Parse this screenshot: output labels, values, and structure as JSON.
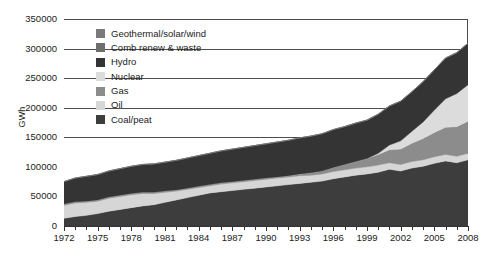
{
  "chart_data": {
    "type": "area",
    "stacked": true,
    "title": "",
    "xlabel": "",
    "ylabel": "GWh",
    "ylim": [
      0,
      350000
    ],
    "ytick_step": 50000,
    "ytick_labels": [
      "350000",
      "300000",
      "250000",
      "200000",
      "150000",
      "100000",
      "50000",
      "0"
    ],
    "ytick_values": [
      350000,
      300000,
      250000,
      200000,
      150000,
      100000,
      50000,
      0
    ],
    "gridlines": [
      300000,
      250000,
      200000,
      150000
    ],
    "grid": true,
    "legend_position": "inside-top-left",
    "xlim": [
      1972,
      2008
    ],
    "x": [
      1972,
      1973,
      1974,
      1975,
      1976,
      1977,
      1978,
      1979,
      1980,
      1981,
      1982,
      1983,
      1984,
      1985,
      1986,
      1987,
      1988,
      1989,
      1990,
      1991,
      1992,
      1993,
      1994,
      1995,
      1996,
      1997,
      1998,
      1999,
      2000,
      2001,
      2002,
      2003,
      2004,
      2005,
      2006,
      2007,
      2008
    ],
    "xtick_labels": [
      "1972",
      "1975",
      "1978",
      "1981",
      "1984",
      "1987",
      "1990",
      "1993",
      "1996",
      "1999",
      "2002",
      "2005",
      "2008"
    ],
    "xtick_values": [
      1972,
      1975,
      1978,
      1981,
      1984,
      1987,
      1990,
      1993,
      1996,
      1999,
      2002,
      2005,
      2008
    ],
    "series": [
      {
        "name": "Coal/peat",
        "color": "#3d3d3d",
        "values": [
          13000,
          16000,
          18000,
          21000,
          25000,
          28000,
          31000,
          34000,
          36000,
          40000,
          44000,
          48000,
          52000,
          56000,
          58000,
          60000,
          62000,
          64000,
          66000,
          68000,
          70000,
          72000,
          74000,
          76000,
          80000,
          83000,
          86000,
          88000,
          91000,
          96000,
          93000,
          98000,
          101000,
          106000,
          110000,
          107000,
          112000
        ]
      },
      {
        "name": "Oil",
        "color": "#d6d6d6",
        "values": [
          22000,
          23000,
          22000,
          21000,
          22000,
          22000,
          22000,
          21000,
          19000,
          17000,
          15000,
          14000,
          13000,
          12000,
          13000,
          13000,
          13000,
          13000,
          13000,
          13000,
          13000,
          13000,
          12000,
          12000,
          12000,
          12000,
          12000,
          12000,
          12000,
          11000,
          11000,
          11000,
          11000,
          11000,
          11000,
          11000,
          11000
        ]
      },
      {
        "name": "Gas",
        "color": "#8c8c8c",
        "values": [
          2000,
          2000,
          2000,
          2000,
          2000,
          2000,
          2000,
          2000,
          2000,
          2000,
          2000,
          2000,
          2000,
          2000,
          2000,
          2000,
          2000,
          2000,
          2000,
          2000,
          2000,
          3000,
          4000,
          5000,
          7000,
          9000,
          11000,
          14000,
          18000,
          22000,
          26000,
          31000,
          36000,
          41000,
          46000,
          50000,
          54000
        ]
      },
      {
        "name": "Nuclear",
        "color": "#dcdcdc",
        "values": [
          0,
          0,
          0,
          0,
          0,
          0,
          0,
          0,
          0,
          0,
          0,
          0,
          0,
          0,
          0,
          0,
          0,
          0,
          0,
          0,
          0,
          0,
          0,
          0,
          0,
          0,
          0,
          0,
          2000,
          8000,
          14000,
          20000,
          28000,
          38000,
          48000,
          56000,
          62000
        ]
      },
      {
        "name": "Hydro",
        "color": "#343434",
        "values": [
          38000,
          40000,
          42000,
          43000,
          44000,
          45000,
          46000,
          47000,
          48000,
          49000,
          50000,
          51000,
          52000,
          53000,
          54000,
          55000,
          56000,
          57000,
          58000,
          59000,
          60000,
          61000,
          62000,
          63000,
          64000,
          64000,
          65000,
          65000,
          66000,
          66000,
          67000,
          67000,
          68000,
          68000,
          69000,
          69000,
          70000
        ]
      },
      {
        "name": "Comb renew & waste",
        "color": "#6e6e6e",
        "values": [
          0,
          0,
          0,
          0,
          0,
          0,
          0,
          0,
          0,
          0,
          0,
          0,
          0,
          0,
          0,
          0,
          0,
          0,
          0,
          0,
          0,
          0,
          0,
          0,
          0,
          0,
          0,
          0,
          0,
          0,
          0,
          0,
          0,
          0,
          0,
          0,
          0
        ]
      },
      {
        "name": "Geothermal/solar/wind",
        "color": "#7a7a7a",
        "values": [
          0,
          0,
          0,
          0,
          0,
          0,
          0,
          0,
          0,
          0,
          0,
          0,
          0,
          0,
          0,
          0,
          0,
          0,
          0,
          0,
          0,
          0,
          0,
          0,
          0,
          0,
          0,
          0,
          0,
          0,
          0,
          0,
          0,
          0,
          0,
          0,
          0
        ]
      }
    ],
    "legend_entries": [
      {
        "label": "Geothermal/solar/wind",
        "color": "#7a7a7a"
      },
      {
        "label": "Comb renew & waste",
        "color": "#6e6e6e"
      },
      {
        "label": "Hydro",
        "color": "#343434"
      },
      {
        "label": "Nuclear",
        "color": "#dcdcdc"
      },
      {
        "label": "Gas",
        "color": "#8c8c8c"
      },
      {
        "label": "Oil",
        "color": "#d6d6d6"
      },
      {
        "label": "Coal/peat",
        "color": "#3d3d3d"
      }
    ],
    "totals": [
      75000,
      81000,
      84000,
      87000,
      93000,
      97000,
      101000,
      104000,
      105000,
      108000,
      111000,
      115000,
      119000,
      123000,
      127000,
      130000,
      133000,
      136000,
      139000,
      142000,
      145000,
      149000,
      152000,
      156000,
      163000,
      168000,
      174000,
      179000,
      189000,
      203000,
      211000,
      227000,
      244000,
      264000,
      284000,
      293000,
      309000
    ]
  },
  "axes": {
    "ylabel": "GWh"
  }
}
